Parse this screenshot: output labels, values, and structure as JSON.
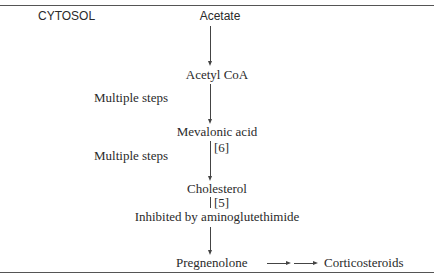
{
  "diagram": {
    "compartment": "CYTOSOL",
    "nodes": [
      {
        "id": "acetate",
        "label": "Acetate"
      },
      {
        "id": "acetyl_coa",
        "label": "Acetyl CoA"
      },
      {
        "id": "mevalonic_acid",
        "label": "Mevalonic acid"
      },
      {
        "id": "cholesterol",
        "label": "Cholesterol"
      },
      {
        "id": "pregnenolone",
        "label": "Pregnenolone"
      },
      {
        "id": "corticosteroids",
        "label": "Corticosteroids"
      }
    ],
    "edges": [
      {
        "from": "acetate",
        "to": "acetyl_coa"
      },
      {
        "from": "acetyl_coa",
        "to": "mevalonic_acid",
        "annotation": "Multiple steps"
      },
      {
        "from": "mevalonic_acid",
        "to": "cholesterol",
        "annotation": "Multiple steps",
        "ref": "[6]"
      },
      {
        "from": "cholesterol",
        "to": "pregnenolone",
        "annotation": "Inhibited by aminoglutethimide",
        "ref": "[5]"
      },
      {
        "from": "pregnenolone",
        "to": "corticosteroids"
      }
    ],
    "side_labels": {
      "steps_1": "Multiple steps",
      "steps_2": "Multiple steps"
    },
    "refs": {
      "ref_6": "[6]",
      "ref_5": "[5]"
    },
    "inhibition_note": "Inhibited by aminoglutethimide"
  }
}
